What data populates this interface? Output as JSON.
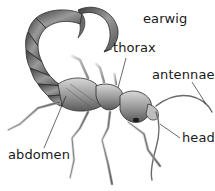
{
  "diagram": {
    "title": "earwig",
    "labels": [
      {
        "id": "thorax",
        "text": "thorax"
      },
      {
        "id": "antennae",
        "text": "antennae"
      },
      {
        "id": "head",
        "text": "head"
      },
      {
        "id": "abdomen",
        "text": "abdomen"
      }
    ],
    "colors": {
      "background": "#ffffff",
      "text": "#1a1a1a",
      "body_dark": "#4a4a4a",
      "body_mid": "#8a8a8a",
      "body_light": "#d0d0d0",
      "outline": "#2a2a2a"
    }
  }
}
